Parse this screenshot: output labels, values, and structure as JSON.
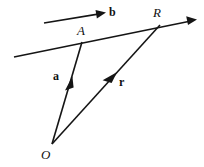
{
  "figure": {
    "background_color": "#ffffff",
    "ink_color": "#151515",
    "width": 204,
    "height": 167,
    "labels": [
      {
        "key": "b",
        "text": "b",
        "kind": "vector",
        "x": 109,
        "y": 6
      },
      {
        "key": "R",
        "text": "R",
        "kind": "point",
        "x": 153,
        "y": 6
      },
      {
        "key": "A",
        "text": "A",
        "kind": "point",
        "x": 77,
        "y": 24
      },
      {
        "key": "a",
        "text": "a",
        "kind": "vector",
        "x": 53,
        "y": 70
      },
      {
        "key": "r",
        "text": "r",
        "kind": "vector",
        "x": 119,
        "y": 76
      },
      {
        "key": "O",
        "text": "O",
        "kind": "point",
        "x": 41,
        "y": 148
      }
    ],
    "strokes": [
      {
        "key": "direction-vector-b",
        "name": "direction vector b",
        "from": [
          44,
          23
        ],
        "to": [
          105,
          13
        ],
        "width": 1.7,
        "arrow": "end"
      },
      {
        "key": "main-line-through-A-R",
        "name": "line through A and R",
        "from": [
          14,
          57
        ],
        "to": [
          196,
          20
        ],
        "width": 1.7,
        "arrow": "end"
      },
      {
        "key": "position-vector-a",
        "name": "position vector a from O to A",
        "from": [
          52,
          144
        ],
        "to": [
          82,
          42
        ],
        "width": 1.6,
        "arrow": "mid"
      },
      {
        "key": "position-vector-r",
        "name": "position vector r from O to R",
        "from": [
          52,
          144
        ],
        "to": [
          160,
          25
        ],
        "width": 1.6,
        "arrow": "mid"
      }
    ]
  }
}
